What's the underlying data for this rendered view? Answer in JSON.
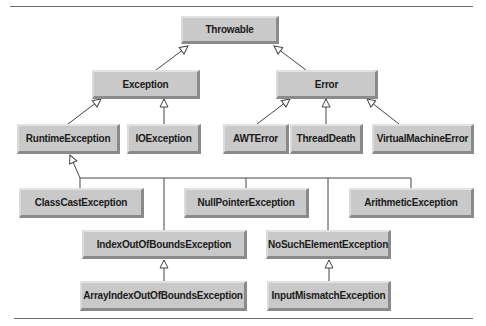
{
  "diagram": {
    "colors": {
      "node_fill": "#c9c9c9",
      "edge": "#444444",
      "rule": "#6a6a6a"
    },
    "nodes": {
      "throwable": "Throwable",
      "exception": "Exception",
      "error": "Error",
      "runtime_exception": "RuntimeException",
      "io_exception": "IOException",
      "awt_error": "AWTError",
      "thread_death": "ThreadDeath",
      "virtual_machine_error": "VirtualMachineError",
      "class_cast_exception": "ClassCastException",
      "null_pointer_exception": "NullPointerException",
      "arithmetic_exception": "ArithmeticException",
      "index_out_of_bounds_exception": "IndexOutOfBoundsException",
      "no_such_element_exception": "NoSuchElementException",
      "array_index_out_of_bounds_exception": "ArrayIndexOutOfBoundsException",
      "input_mismatch_exception": "InputMismatchException"
    },
    "edges": [
      [
        "Exception",
        "Throwable"
      ],
      [
        "Error",
        "Throwable"
      ],
      [
        "RuntimeException",
        "Exception"
      ],
      [
        "IOException",
        "Exception"
      ],
      [
        "AWTError",
        "Error"
      ],
      [
        "ThreadDeath",
        "Error"
      ],
      [
        "VirtualMachineError",
        "Error"
      ],
      [
        "ClassCastException",
        "RuntimeException"
      ],
      [
        "NullPointerException",
        "RuntimeException"
      ],
      [
        "ArithmeticException",
        "RuntimeException"
      ],
      [
        "IndexOutOfBoundsException",
        "RuntimeException"
      ],
      [
        "NoSuchElementException",
        "RuntimeException"
      ],
      [
        "ArrayIndexOutOfBoundsException",
        "IndexOutOfBoundsException"
      ],
      [
        "InputMismatchException",
        "NoSuchElementException"
      ]
    ]
  }
}
